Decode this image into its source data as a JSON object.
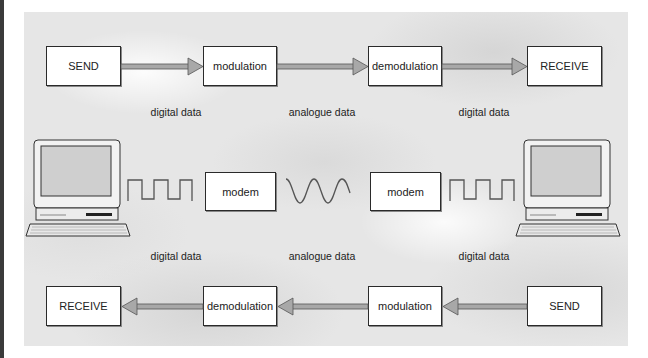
{
  "diagram": {
    "title": "",
    "top_row": {
      "direction": "left-to-right",
      "boxes": [
        "SEND",
        "modulation",
        "demodulation",
        "RECEIVE"
      ],
      "labels": [
        "digital data",
        "analogue data",
        "digital data"
      ]
    },
    "middle_row": {
      "left_device": "computer-icon",
      "left_signal": "square-wave",
      "left_modem": "modem",
      "channel_signal": "sine-wave",
      "right_modem": "modem",
      "right_signal": "square-wave",
      "right_device": "computer-icon",
      "labels": [
        "digital data",
        "analogue data",
        "digital data"
      ]
    },
    "bottom_row": {
      "direction": "right-to-left",
      "boxes": [
        "RECEIVE",
        "demodulation",
        "modulation",
        "SEND"
      ]
    },
    "colors": {
      "box_border": "#2a2a2a",
      "arrow_fill": "#a8a8a8",
      "background": "#e6e6e6"
    }
  }
}
